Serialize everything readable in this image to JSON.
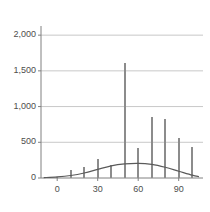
{
  "chart_data": {
    "type": "bar",
    "title": "",
    "subtitle": "",
    "xlabel": "",
    "ylabel": "",
    "xlim": [
      -12,
      108
    ],
    "ylim": [
      0,
      2100
    ],
    "grid": "horizontal",
    "legend": null,
    "bar_color": "#8c8c8c",
    "curve_color": "#5a5a5a",
    "grid_color": "#c8c8c8",
    "axis_color": "#808080",
    "text_color": "#4d4d4d",
    "x": [
      0,
      10,
      20,
      30,
      40,
      50,
      60,
      70,
      80,
      90,
      100
    ],
    "values": [
      20,
      110,
      155,
      265,
      180,
      1610,
      420,
      850,
      830,
      555,
      430
    ],
    "yticks": [
      0,
      500,
      1000,
      1500,
      2000
    ],
    "ytick_labels": [
      "0",
      "500",
      "1,000",
      "1,500",
      "2,000"
    ],
    "xticks": [
      0,
      30,
      60,
      90
    ],
    "xtick_labels": [
      "0",
      "30",
      "60",
      "90"
    ],
    "series": [
      {
        "name": "impulses",
        "type": "bar",
        "values": [
          20,
          110,
          155,
          265,
          180,
          1610,
          420,
          850,
          830,
          555,
          430
        ]
      },
      {
        "name": "fitted-curve",
        "type": "line",
        "x": [
          -10,
          0,
          10,
          20,
          30,
          40,
          50,
          60,
          70,
          80,
          90,
          100,
          105
        ],
        "values": [
          5,
          15,
          35,
          70,
          120,
          170,
          197,
          205,
          190,
          150,
          95,
          40,
          20
        ]
      }
    ]
  }
}
